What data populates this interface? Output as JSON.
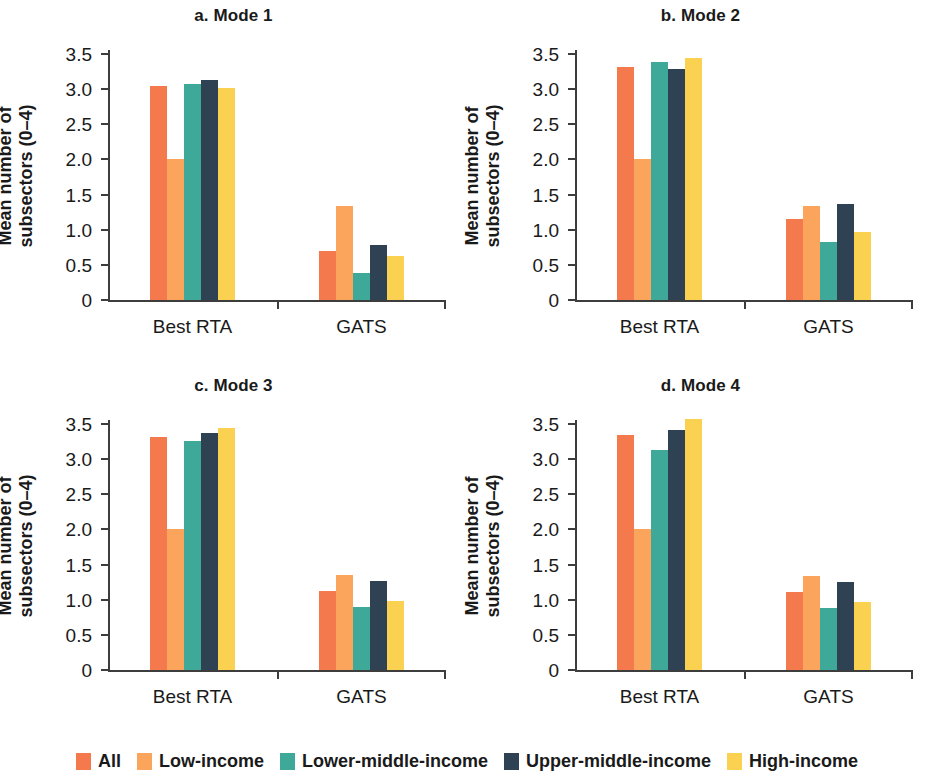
{
  "figure": {
    "y_axis_title_line1": "Mean number of",
    "y_axis_title_line2": "subsectors (0–4)",
    "y_ticks": [
      "0",
      "0.5",
      "1.0",
      "1.5",
      "2.0",
      "2.5",
      "3.0",
      "3.5"
    ],
    "group_labels": [
      "Best RTA",
      "GATS"
    ]
  },
  "legend": {
    "items": [
      {
        "label": "All",
        "color": "#f4794c"
      },
      {
        "label": "Low-income",
        "color": "#fba45c"
      },
      {
        "label": "Lower-middle-income",
        "color": "#3ea899"
      },
      {
        "label": "Upper-middle-income",
        "color": "#2e4254"
      },
      {
        "label": "High-income",
        "color": "#fbd152"
      }
    ]
  },
  "chart_data": [
    {
      "type": "bar",
      "title": "a. Mode 1",
      "xlabel": "",
      "ylabel": "Mean number of subsectors (0–4)",
      "ylim": [
        0,
        3.5
      ],
      "yticks": [
        0,
        0.5,
        1.0,
        1.5,
        2.0,
        2.5,
        3.0,
        3.5
      ],
      "grid": false,
      "legend_position": "bottom",
      "categories": [
        "Best RTA",
        "GATS"
      ],
      "series": [
        {
          "name": "All",
          "values": [
            3.04,
            0.7
          ]
        },
        {
          "name": "Low-income",
          "values": [
            2.0,
            1.34
          ]
        },
        {
          "name": "Lower-middle-income",
          "values": [
            3.07,
            0.39
          ]
        },
        {
          "name": "Upper-middle-income",
          "values": [
            3.13,
            0.78
          ]
        },
        {
          "name": "High-income",
          "values": [
            3.01,
            0.62
          ]
        }
      ]
    },
    {
      "type": "bar",
      "title": "b. Mode 2",
      "xlabel": "",
      "ylabel": "Mean number of subsectors (0–4)",
      "ylim": [
        0,
        3.5
      ],
      "yticks": [
        0,
        0.5,
        1.0,
        1.5,
        2.0,
        2.5,
        3.0,
        3.5
      ],
      "grid": false,
      "legend_position": "bottom",
      "categories": [
        "Best RTA",
        "GATS"
      ],
      "series": [
        {
          "name": "All",
          "values": [
            3.31,
            1.15
          ]
        },
        {
          "name": "Low-income",
          "values": [
            2.0,
            1.34
          ]
        },
        {
          "name": "Lower-middle-income",
          "values": [
            3.38,
            0.83
          ]
        },
        {
          "name": "Upper-middle-income",
          "values": [
            3.28,
            1.37
          ]
        },
        {
          "name": "High-income",
          "values": [
            3.44,
            0.97
          ]
        }
      ]
    },
    {
      "type": "bar",
      "title": "c. Mode 3",
      "xlabel": "",
      "ylabel": "Mean number of subsectors (0–4)",
      "ylim": [
        0,
        3.5
      ],
      "yticks": [
        0,
        0.5,
        1.0,
        1.5,
        2.0,
        2.5,
        3.0,
        3.5
      ],
      "grid": false,
      "legend_position": "bottom",
      "categories": [
        "Best RTA",
        "GATS"
      ],
      "series": [
        {
          "name": "All",
          "values": [
            3.31,
            1.12
          ]
        },
        {
          "name": "Low-income",
          "values": [
            2.0,
            1.35
          ]
        },
        {
          "name": "Lower-middle-income",
          "values": [
            3.26,
            0.89
          ]
        },
        {
          "name": "Upper-middle-income",
          "values": [
            3.37,
            1.26
          ]
        },
        {
          "name": "High-income",
          "values": [
            3.45,
            0.98
          ]
        }
      ]
    },
    {
      "type": "bar",
      "title": "d. Mode 4",
      "xlabel": "",
      "ylabel": "Mean number of subsectors (0–4)",
      "ylim": [
        0,
        3.5
      ],
      "yticks": [
        0,
        0.5,
        1.0,
        1.5,
        2.0,
        2.5,
        3.0,
        3.5
      ],
      "grid": false,
      "legend_position": "bottom",
      "categories": [
        "Best RTA",
        "GATS"
      ],
      "series": [
        {
          "name": "All",
          "values": [
            3.34,
            1.11
          ]
        },
        {
          "name": "Low-income",
          "values": [
            2.0,
            1.34
          ]
        },
        {
          "name": "Lower-middle-income",
          "values": [
            3.13,
            0.88
          ]
        },
        {
          "name": "Upper-middle-income",
          "values": [
            3.41,
            1.25
          ]
        },
        {
          "name": "High-income",
          "values": [
            3.57,
            0.97
          ]
        }
      ]
    }
  ]
}
